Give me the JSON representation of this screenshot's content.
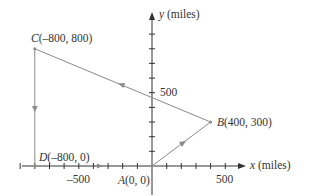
{
  "axes": {
    "x_label_var": "x",
    "x_label_unit": " (miles)",
    "y_label_var": "y",
    "y_label_unit": " (miles)",
    "x_tick_labels": [
      "–500",
      "500"
    ],
    "y_tick_labels": [
      "500"
    ],
    "tick_spacing": 100
  },
  "points": {
    "A": {
      "name": "A",
      "coords": "(0, 0)",
      "x": 0,
      "y": 0
    },
    "B": {
      "name": "B",
      "coords": "(400, 300)",
      "x": 400,
      "y": 300
    },
    "C": {
      "name": "C",
      "coords": "(–800, 800)",
      "x": -800,
      "y": 800
    },
    "D": {
      "name": "D",
      "coords": "(–800, 0)",
      "x": -800,
      "y": 0
    }
  },
  "path_order": [
    "A",
    "B",
    "C",
    "D",
    "A"
  ],
  "colors": {
    "axis": "#333333",
    "path": "#8a8a8a",
    "text": "#333333"
  }
}
